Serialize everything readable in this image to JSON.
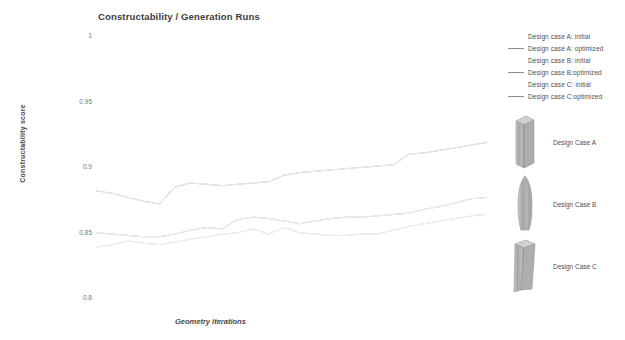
{
  "header": {
    "title": "Constructability / Generation Runs"
  },
  "axes": {
    "y_title": "Constructability score",
    "x_title": "Geometry iterations",
    "y_ticks": [
      "1",
      "0.95",
      "0.9",
      "0.85",
      "0.8"
    ]
  },
  "legend": {
    "items": [
      {
        "label": "Design case A: initial",
        "color": "#ffffff",
        "swatch_visible": false
      },
      {
        "label": "Design case A: optimized",
        "color": "#8c8c8c",
        "swatch_visible": true
      },
      {
        "label": "Design case B: initial",
        "color": "#ffffff",
        "swatch_visible": false
      },
      {
        "label": "Design case B:optimized",
        "color": "#8c8c8c",
        "swatch_visible": true
      },
      {
        "label": "Design case C: initial",
        "color": "#ffffff",
        "swatch_visible": false
      },
      {
        "label": "Design case C:optimized",
        "color": "#8c8c8c",
        "swatch_visible": true
      }
    ]
  },
  "thumbnails": {
    "items": [
      {
        "caption": "Design Case A",
        "shape": "rectangular-column"
      },
      {
        "caption": "Design Case B",
        "shape": "tapered-bullet-column"
      },
      {
        "caption": "Design Case C",
        "shape": "flared-base-column"
      }
    ]
  },
  "chart_data": {
    "type": "line",
    "title": "Constructability / Generation Runs",
    "xlabel": "Geometry iterations",
    "ylabel": "Constructability score",
    "ylim": [
      0.8,
      1.0
    ],
    "xlim": [
      0,
      25
    ],
    "grid": false,
    "legend_position": "top-right",
    "x": [
      0,
      1,
      2,
      3,
      4,
      5,
      6,
      7,
      8,
      9,
      10,
      11,
      12,
      13,
      14,
      15,
      16,
      17,
      18,
      19,
      20,
      21,
      22,
      23,
      24,
      25
    ],
    "series": [
      {
        "name": "Design case A: optimized",
        "color": "#8c8c8c",
        "values": [
          0.881,
          0.879,
          0.876,
          0.873,
          0.871,
          0.884,
          0.887,
          0.886,
          0.885,
          0.886,
          0.887,
          0.888,
          0.893,
          0.895,
          0.896,
          0.897,
          0.898,
          0.899,
          0.9,
          0.901,
          0.909,
          0.91,
          0.912,
          0.914,
          0.916,
          0.918
        ]
      },
      {
        "name": "Design case B:optimized",
        "color": "#9a9a9a",
        "values": [
          0.849,
          0.848,
          0.847,
          0.846,
          0.846,
          0.848,
          0.851,
          0.853,
          0.852,
          0.859,
          0.861,
          0.86,
          0.858,
          0.856,
          0.858,
          0.86,
          0.861,
          0.861,
          0.862,
          0.863,
          0.864,
          0.867,
          0.869,
          0.872,
          0.875,
          0.876
        ]
      },
      {
        "name": "Design case C:optimized",
        "color": "#b4b4b4",
        "values": [
          0.838,
          0.84,
          0.843,
          0.841,
          0.84,
          0.842,
          0.844,
          0.846,
          0.848,
          0.849,
          0.852,
          0.848,
          0.853,
          0.849,
          0.848,
          0.847,
          0.847,
          0.848,
          0.848,
          0.851,
          0.854,
          0.856,
          0.858,
          0.86,
          0.862,
          0.863
        ]
      },
      {
        "name": "Design case A: initial",
        "color": "#fdfdfd",
        "values": [
          0.881,
          0.879,
          0.876,
          0.873,
          0.871,
          0.884,
          0.887,
          0.886,
          0.885,
          0.886,
          0.887,
          0.888,
          0.893,
          0.895,
          0.896,
          0.897,
          0.898,
          0.899,
          0.9,
          0.901,
          0.909,
          0.91,
          0.912,
          0.914,
          0.916,
          0.918
        ]
      },
      {
        "name": "Design case B: initial",
        "color": "#fdfdfd",
        "values": [
          0.849,
          0.848,
          0.847,
          0.846,
          0.846,
          0.848,
          0.851,
          0.853,
          0.852,
          0.859,
          0.861,
          0.86,
          0.858,
          0.856,
          0.858,
          0.86,
          0.861,
          0.861,
          0.862,
          0.863,
          0.864,
          0.867,
          0.869,
          0.872,
          0.875,
          0.876
        ]
      },
      {
        "name": "Design case C: initial",
        "color": "#fdfdfd",
        "values": [
          0.838,
          0.84,
          0.843,
          0.841,
          0.84,
          0.842,
          0.844,
          0.846,
          0.848,
          0.849,
          0.852,
          0.848,
          0.853,
          0.849,
          0.848,
          0.847,
          0.847,
          0.848,
          0.848,
          0.851,
          0.854,
          0.856,
          0.858,
          0.86,
          0.862,
          0.863
        ]
      }
    ]
  }
}
